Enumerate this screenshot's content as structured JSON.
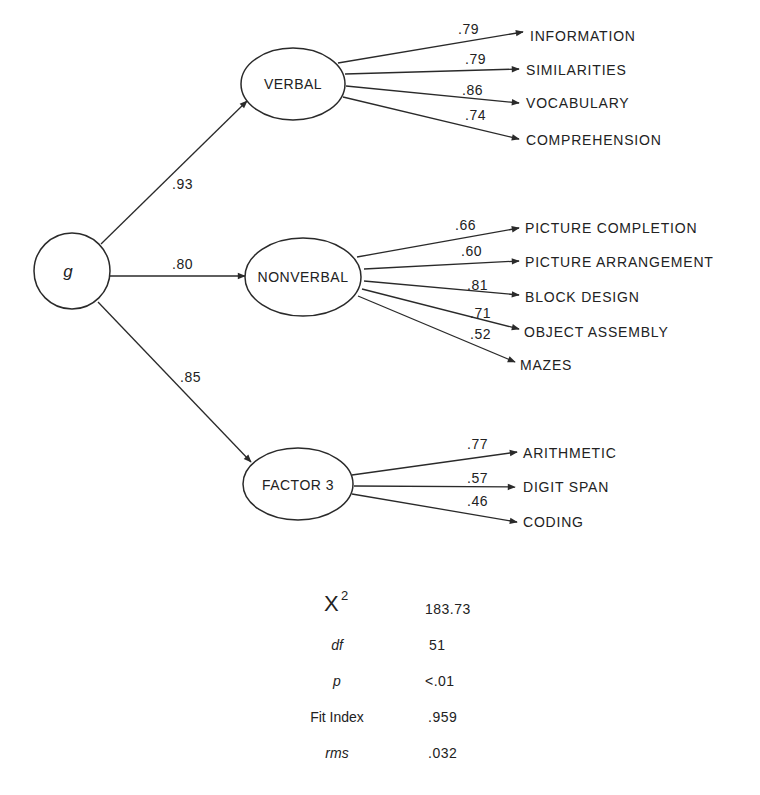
{
  "diagram": {
    "type": "confirmatory factor analysis path diagram",
    "general_factor": {
      "label": "g"
    },
    "factors": [
      {
        "label": "VERBAL",
        "loading_on_g": ".93",
        "indicators": [
          {
            "label": "INFORMATION",
            "loading": ".79"
          },
          {
            "label": "SIMILARITIES",
            "loading": ".79"
          },
          {
            "label": "VOCABULARY",
            "loading": ".86"
          },
          {
            "label": "COMPREHENSION",
            "loading": ".74"
          }
        ]
      },
      {
        "label": "NONVERBAL",
        "loading_on_g": ".80",
        "indicators": [
          {
            "label": "PICTURE COMPLETION",
            "loading": ".66"
          },
          {
            "label": "PICTURE ARRANGEMENT",
            "loading": ".60"
          },
          {
            "label": "BLOCK DESIGN",
            "loading": ".81"
          },
          {
            "label": "OBJECT ASSEMBLY",
            "loading": ".71"
          },
          {
            "label": "MAZES",
            "loading": ".52"
          }
        ]
      },
      {
        "label": "FACTOR 3",
        "loading_on_g": ".85",
        "indicators": [
          {
            "label": "ARITHMETIC",
            "loading": ".77"
          },
          {
            "label": "DIGIT SPAN",
            "loading": ".57"
          },
          {
            "label": "CODING",
            "loading": ".46"
          }
        ]
      }
    ]
  },
  "fit_statistics": {
    "chi_square": {
      "label": "X",
      "superscript": "2",
      "value": "183.73"
    },
    "df": {
      "label": "df",
      "value": "51"
    },
    "p": {
      "label": "p",
      "value": "<.01"
    },
    "fit_index": {
      "label": "Fit Index",
      "value": ".959"
    },
    "rms": {
      "label": "rms",
      "value": ".032"
    }
  },
  "colors": {
    "ink": "#222222",
    "background": "#ffffff"
  }
}
